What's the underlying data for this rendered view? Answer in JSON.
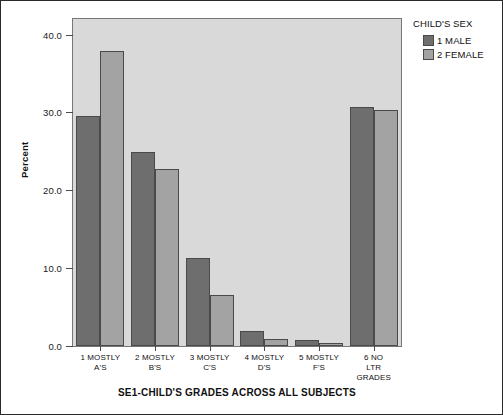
{
  "chart_data": {
    "type": "bar",
    "title": "",
    "xlabel": "SE1-CHILD'S GRADES ACROSS ALL SUBJECTS",
    "ylabel": "Percent",
    "ylim": [
      0,
      42
    ],
    "yticks": [
      0.0,
      10.0,
      20.0,
      30.0,
      40.0
    ],
    "ytick_labels": [
      "0.0",
      "10.0",
      "20.0",
      "30.0",
      "40.0"
    ],
    "grid": false,
    "legend_position": "right-top",
    "legend_title": "CHILD'S SEX",
    "categories": [
      "1  MOSTLY\nA'S",
      "2  MOSTLY\nB'S",
      "3  MOSTLY\nC'S",
      "4  MOSTLY\nD'S",
      "5  MOSTLY\nF'S",
      "6  NO LTR\nGRADES"
    ],
    "series": [
      {
        "name": "1 MALE",
        "color": "#6e6e6e",
        "values": [
          29.6,
          24.9,
          11.3,
          1.9,
          0.8,
          30.7
        ]
      },
      {
        "name": "2 FEMALE",
        "color": "#a3a3a3",
        "values": [
          37.9,
          22.7,
          6.5,
          0.9,
          0.4,
          30.3
        ]
      }
    ]
  },
  "colors": {
    "plot_background": "#d9d9d9",
    "page_background": "#ffffff",
    "axis": "#4a4a4a",
    "male": "#6e6e6e",
    "female": "#a3a3a3"
  }
}
